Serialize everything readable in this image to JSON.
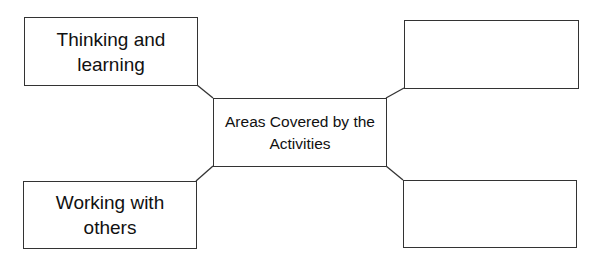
{
  "diagram": {
    "type": "spider-map",
    "center": {
      "label": "Areas Covered by the Activities"
    },
    "nodes": [
      {
        "position": "top-left",
        "label": "Thinking and learning"
      },
      {
        "position": "top-right",
        "label": ""
      },
      {
        "position": "bottom-left",
        "label": "Working with others"
      },
      {
        "position": "bottom-right",
        "label": ""
      }
    ],
    "colors": {
      "stroke": "#333333",
      "background": "#ffffff",
      "text": "#111111"
    }
  }
}
